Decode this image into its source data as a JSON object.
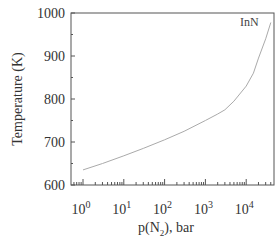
{
  "chart_data": {
    "type": "line",
    "title": "",
    "xlabel": "p(N2), bar",
    "xlabel_parts": {
      "pre": "p(N",
      "sub": "2",
      "post": "), bar"
    },
    "ylabel": "Temperature (K)",
    "xscale": "log",
    "xlim": [
      0.7,
      60000
    ],
    "ylim": [
      600,
      1000
    ],
    "grid": false,
    "legend_position": "none",
    "yticks": [
      600,
      700,
      800,
      900,
      1000
    ],
    "xticks": [
      {
        "base": "10",
        "exp": "0",
        "value": 1
      },
      {
        "base": "10",
        "exp": "1",
        "value": 10
      },
      {
        "base": "10",
        "exp": "2",
        "value": 100
      },
      {
        "base": "10",
        "exp": "3",
        "value": 1000
      },
      {
        "base": "10",
        "exp": "4",
        "value": 10000
      }
    ],
    "series": [
      {
        "name": "InN",
        "x": [
          1,
          3,
          10,
          30,
          100,
          300,
          1000,
          2000,
          3000,
          5000,
          10000,
          15000,
          20000,
          30000,
          40000
        ],
        "y": [
          635,
          650,
          668,
          685,
          705,
          725,
          750,
          765,
          775,
          795,
          830,
          860,
          895,
          940,
          978
        ]
      }
    ],
    "annotations": [
      {
        "text": "InN",
        "x": 25000,
        "y": 975
      }
    ]
  }
}
